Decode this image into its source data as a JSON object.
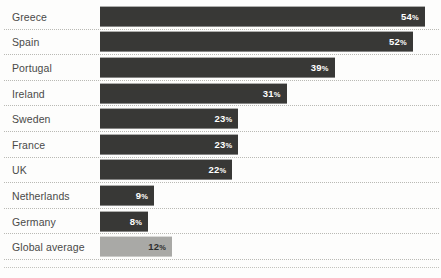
{
  "chart_data": {
    "type": "bar",
    "title": "",
    "xlabel": "",
    "ylabel": "",
    "orientation": "horizontal",
    "value_suffix": "%",
    "xlim": [
      0,
      56
    ],
    "grid": false,
    "legend": "none",
    "categories": [
      "Greece",
      "Spain",
      "Portugal",
      "Ireland",
      "Sweden",
      "France",
      "UK",
      "Netherlands",
      "Germany",
      "Global average"
    ],
    "values": [
      54,
      52,
      39,
      31,
      23,
      23,
      22,
      9,
      8,
      12
    ],
    "value_labels": [
      "54",
      "52",
      "39",
      "31",
      "23",
      "23",
      "22",
      "9",
      "8",
      "12"
    ],
    "bar_colors": [
      "#383836",
      "#383836",
      "#383836",
      "#383836",
      "#383836",
      "#383836",
      "#383836",
      "#383836",
      "#383836",
      "#a9a9a6"
    ],
    "highlight_index": 9,
    "colors": {
      "bar_dark": "#383836",
      "bar_light": "#a9a9a6",
      "label_text": "#4a4a48",
      "value_text_on_dark": "#ffffff",
      "value_text_on_light": "#2e2e2c",
      "rule": "#b9b9b4",
      "background": "#fdfdfc"
    },
    "rows": [
      {
        "label": "Greece",
        "value": 54,
        "value_label": "54",
        "suffix": "%",
        "style": "dark"
      },
      {
        "label": "Spain",
        "value": 52,
        "value_label": "52",
        "suffix": "%",
        "style": "dark"
      },
      {
        "label": "Portugal",
        "value": 39,
        "value_label": "39",
        "suffix": "%",
        "style": "dark"
      },
      {
        "label": "Ireland",
        "value": 31,
        "value_label": "31",
        "suffix": "%",
        "style": "dark"
      },
      {
        "label": "Sweden",
        "value": 23,
        "value_label": "23",
        "suffix": "%",
        "style": "dark"
      },
      {
        "label": "France",
        "value": 23,
        "value_label": "23",
        "suffix": "%",
        "style": "dark"
      },
      {
        "label": "UK",
        "value": 22,
        "value_label": "22",
        "suffix": "%",
        "style": "dark"
      },
      {
        "label": "Netherlands",
        "value": 9,
        "value_label": "9",
        "suffix": "%",
        "style": "dark"
      },
      {
        "label": "Germany",
        "value": 8,
        "value_label": "8",
        "suffix": "%",
        "style": "dark"
      },
      {
        "label": "Global average",
        "value": 12,
        "value_label": "12",
        "suffix": "%",
        "style": "light"
      }
    ]
  }
}
